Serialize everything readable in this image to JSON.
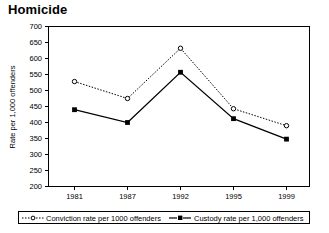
{
  "chart_data": {
    "type": "line",
    "title": "Homicide",
    "xlabel": "",
    "ylabel": "Rate per 1,000 offenders",
    "categories": [
      "1981",
      "1987",
      "1992",
      "1995",
      "1999"
    ],
    "ylim": [
      200,
      700
    ],
    "ytick_step": 50,
    "yticks": [
      "200",
      "250",
      "300",
      "350",
      "400",
      "450",
      "500",
      "550",
      "600",
      "650",
      "700"
    ],
    "grid": false,
    "legend_position": "bottom",
    "series": [
      {
        "name": "Conviction rate per 1000 offenders",
        "values": [
          528,
          475,
          632,
          443,
          390
        ],
        "marker": "open-circle",
        "line_style": "dotted",
        "color": "#000000"
      },
      {
        "name": "Custody rate per 1,000 offenders",
        "values": [
          440,
          400,
          557,
          412,
          348
        ],
        "marker": "filled-square",
        "line_style": "solid",
        "color": "#000000"
      }
    ]
  },
  "legend": {
    "entries": [
      {
        "label": "Conviction rate per 1000 offenders"
      },
      {
        "label": "Custody rate per 1,000 offenders"
      }
    ]
  }
}
